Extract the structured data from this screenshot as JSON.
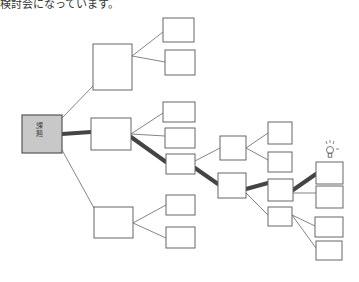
{
  "header": {
    "text": "検討会になっています。"
  },
  "root": {
    "label": "課題",
    "x": 22,
    "y": 115,
    "w": 40,
    "h": 38,
    "fill": "#c8c8c8"
  },
  "colors": {
    "stroke": "#666666",
    "thick": "#444444",
    "root_fill": "#c8c8c8"
  },
  "boxes": [
    {
      "id": "A",
      "x": 93,
      "y": 44,
      "w": 39,
      "h": 46
    },
    {
      "id": "B",
      "x": 91,
      "y": 118,
      "w": 40,
      "h": 32
    },
    {
      "id": "C",
      "x": 94,
      "y": 207,
      "w": 39,
      "h": 31
    },
    {
      "id": "A1",
      "x": 163,
      "y": 18,
      "w": 31,
      "h": 24
    },
    {
      "id": "A2",
      "x": 165,
      "y": 50,
      "w": 30,
      "h": 25
    },
    {
      "id": "B1",
      "x": 163,
      "y": 102,
      "w": 32,
      "h": 20
    },
    {
      "id": "B2",
      "x": 165,
      "y": 128,
      "w": 30,
      "h": 20
    },
    {
      "id": "B3",
      "x": 166,
      "y": 154,
      "w": 29,
      "h": 20
    },
    {
      "id": "C1",
      "x": 166,
      "y": 195,
      "w": 29,
      "h": 20
    },
    {
      "id": "C2",
      "x": 166,
      "y": 227,
      "w": 29,
      "h": 21
    },
    {
      "id": "D",
      "x": 220,
      "y": 136,
      "w": 26,
      "h": 24
    },
    {
      "id": "E",
      "x": 218,
      "y": 173,
      "w": 28,
      "h": 25
    },
    {
      "id": "D1",
      "x": 268,
      "y": 122,
      "w": 24,
      "h": 22
    },
    {
      "id": "D2",
      "x": 268,
      "y": 152,
      "w": 24,
      "h": 20
    },
    {
      "id": "E1",
      "x": 268,
      "y": 179,
      "w": 25,
      "h": 22
    },
    {
      "id": "E2",
      "x": 268,
      "y": 207,
      "w": 24,
      "h": 19
    },
    {
      "id": "F1",
      "x": 316,
      "y": 162,
      "w": 27,
      "h": 22
    },
    {
      "id": "F2",
      "x": 316,
      "y": 186,
      "w": 27,
      "h": 22
    },
    {
      "id": "G1",
      "x": 315,
      "y": 217,
      "w": 28,
      "h": 20
    },
    {
      "id": "G2",
      "x": 316,
      "y": 241,
      "w": 26,
      "h": 19
    }
  ],
  "edges": [
    {
      "x1": 62,
      "y1": 118,
      "x2": 93,
      "y2": 86,
      "thick": false
    },
    {
      "x1": 62,
      "y1": 134,
      "x2": 91,
      "y2": 132,
      "thick": true
    },
    {
      "x1": 62,
      "y1": 150,
      "x2": 94,
      "y2": 208,
      "thick": false
    },
    {
      "x1": 132,
      "y1": 56,
      "x2": 163,
      "y2": 32,
      "thick": false
    },
    {
      "x1": 132,
      "y1": 56,
      "x2": 165,
      "y2": 62,
      "thick": false
    },
    {
      "x1": 131,
      "y1": 134,
      "x2": 163,
      "y2": 113,
      "thick": false
    },
    {
      "x1": 131,
      "y1": 134,
      "x2": 165,
      "y2": 136,
      "thick": false
    },
    {
      "x1": 131,
      "y1": 137,
      "x2": 166,
      "y2": 162,
      "thick": true
    },
    {
      "x1": 133,
      "y1": 223,
      "x2": 166,
      "y2": 205,
      "thick": false
    },
    {
      "x1": 133,
      "y1": 223,
      "x2": 166,
      "y2": 238,
      "thick": false
    },
    {
      "x1": 195,
      "y1": 161,
      "x2": 220,
      "y2": 148,
      "thick": false
    },
    {
      "x1": 195,
      "y1": 168,
      "x2": 218,
      "y2": 184,
      "thick": true
    },
    {
      "x1": 246,
      "y1": 148,
      "x2": 268,
      "y2": 133,
      "thick": false
    },
    {
      "x1": 246,
      "y1": 148,
      "x2": 268,
      "y2": 160,
      "thick": false
    },
    {
      "x1": 246,
      "y1": 189,
      "x2": 268,
      "y2": 183,
      "thick": true
    },
    {
      "x1": 246,
      "y1": 193,
      "x2": 268,
      "y2": 215,
      "thick": false
    },
    {
      "x1": 293,
      "y1": 190,
      "x2": 316,
      "y2": 174,
      "thick": true
    },
    {
      "x1": 293,
      "y1": 193,
      "x2": 316,
      "y2": 193,
      "thick": false
    },
    {
      "x1": 292,
      "y1": 215,
      "x2": 315,
      "y2": 226,
      "thick": false
    },
    {
      "x1": 292,
      "y1": 215,
      "x2": 316,
      "y2": 248,
      "thick": false
    }
  ],
  "lightbulb": {
    "icon": "lightbulb-icon",
    "x": 330,
    "y": 150
  }
}
